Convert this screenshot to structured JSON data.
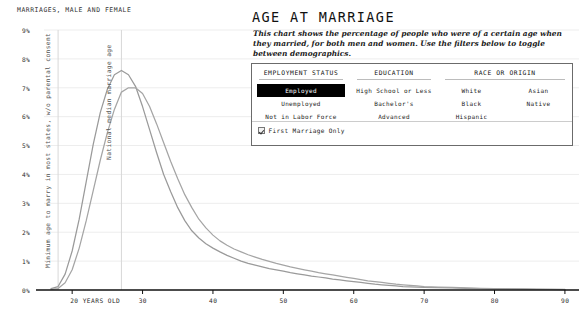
{
  "chart_header": "MARRIAGES, MALE AND FEMALE",
  "title": "AGE AT MARRIAGE",
  "subtitle": "This chart shows the percentage of people who were of a certain age when they married, for both men and women. Use the filters below to toggle between demographics.",
  "annotations": {
    "min_age": "Minimum age to marry in most states, w/o parental consent",
    "median_age": "National median marriage age"
  },
  "filters": {
    "employment": {
      "header": "EMPLOYMENT STATUS",
      "options": [
        "Employed",
        "Unemployed",
        "Not in Labor Force"
      ],
      "selected": "Employed"
    },
    "education": {
      "header": "EDUCATION",
      "options": [
        "High School or Less",
        "Bachelor's",
        "Advanced"
      ],
      "selected": null
    },
    "race": {
      "header": "RACE OR ORIGIN",
      "options_left": [
        "White",
        "Black",
        "Hispanic"
      ],
      "options_right": [
        "Asian",
        "Native"
      ],
      "selected": null
    },
    "first_marriage_only": {
      "label": "First Marriage Only",
      "checked": true
    }
  },
  "chart_data": {
    "type": "line",
    "title": "MARRIAGES, MALE AND FEMALE",
    "xlabel": "Age",
    "ylabel": "Percent of marriages",
    "xlim": [
      16,
      92
    ],
    "ylim": [
      0,
      9
    ],
    "grid": true,
    "legend_position": "none",
    "xtick_values": [
      20,
      30,
      40,
      50,
      60,
      70,
      80,
      90
    ],
    "xtick_labels": [
      "20 YEARS OLD",
      "30",
      "40",
      "50",
      "60",
      "70",
      "80",
      "90"
    ],
    "ytick_values": [
      0,
      1,
      2,
      3,
      4,
      5,
      6,
      7,
      8,
      9
    ],
    "ytick_labels": [
      "0%",
      "1%",
      "2%",
      "3%",
      "4%",
      "5%",
      "6%",
      "7%",
      "8%",
      "9%"
    ],
    "vlines": [
      {
        "x": 18,
        "label": "Minimum age to marry in most states, w/o parental consent"
      },
      {
        "x": 27,
        "label": "National median marriage age"
      }
    ],
    "x": [
      17,
      18,
      19,
      20,
      21,
      22,
      23,
      24,
      25,
      26,
      27,
      28,
      29,
      30,
      31,
      32,
      33,
      34,
      35,
      36,
      37,
      38,
      39,
      40,
      41,
      42,
      43,
      44,
      45,
      46,
      47,
      48,
      49,
      50,
      51,
      52,
      53,
      54,
      55,
      56,
      57,
      58,
      59,
      60,
      61,
      62,
      63,
      64,
      65,
      66,
      67,
      68,
      69,
      70,
      72,
      74,
      76,
      78,
      80,
      82,
      84,
      86,
      88,
      90
    ],
    "series": [
      {
        "name": "Female",
        "color": "#9a9a9a",
        "values": [
          0.05,
          0.12,
          0.55,
          1.35,
          2.45,
          3.75,
          5.05,
          6.15,
          6.95,
          7.45,
          7.6,
          7.45,
          7.05,
          6.35,
          5.55,
          4.75,
          4.0,
          3.4,
          2.85,
          2.4,
          2.05,
          1.8,
          1.6,
          1.45,
          1.32,
          1.2,
          1.1,
          1.0,
          0.92,
          0.86,
          0.8,
          0.74,
          0.7,
          0.65,
          0.6,
          0.56,
          0.52,
          0.48,
          0.45,
          0.42,
          0.38,
          0.35,
          0.32,
          0.29,
          0.26,
          0.23,
          0.2,
          0.18,
          0.16,
          0.14,
          0.12,
          0.11,
          0.1,
          0.09,
          0.08,
          0.07,
          0.06,
          0.05,
          0.04,
          0.035,
          0.03,
          0.025,
          0.02,
          0.015
        ]
      },
      {
        "name": "Male",
        "color": "#a5a5a5",
        "values": [
          0.02,
          0.05,
          0.25,
          0.7,
          1.45,
          2.4,
          3.45,
          4.5,
          5.45,
          6.25,
          6.85,
          7.0,
          7.0,
          6.8,
          6.35,
          5.75,
          5.1,
          4.45,
          3.85,
          3.3,
          2.85,
          2.45,
          2.15,
          1.9,
          1.7,
          1.55,
          1.42,
          1.32,
          1.22,
          1.14,
          1.06,
          0.99,
          0.92,
          0.86,
          0.8,
          0.75,
          0.7,
          0.65,
          0.6,
          0.56,
          0.52,
          0.48,
          0.44,
          0.4,
          0.36,
          0.32,
          0.29,
          0.26,
          0.23,
          0.2,
          0.18,
          0.16,
          0.14,
          0.12,
          0.1,
          0.09,
          0.07,
          0.06,
          0.05,
          0.04,
          0.035,
          0.03,
          0.025,
          0.02
        ]
      }
    ]
  }
}
